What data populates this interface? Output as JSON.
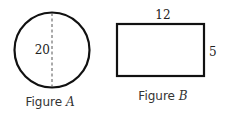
{
  "figures": {
    "a": {
      "shape": "circle",
      "diameter_label": "20",
      "caption_prefix": "Figure ",
      "caption_letter": "A"
    },
    "b": {
      "shape": "rectangle",
      "width_label": "12",
      "height_label": "5",
      "caption_prefix": "Figure ",
      "caption_letter": "B"
    }
  },
  "colors": {
    "stroke": "#111111",
    "text": "#333333"
  }
}
